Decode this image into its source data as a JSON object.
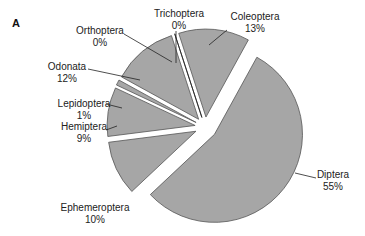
{
  "panel_label": "A",
  "chart_data": {
    "type": "pie",
    "title": "",
    "panel": "A",
    "exploded": true,
    "start_angle_deg": -18,
    "direction": "clockwise",
    "slice_color": "#a6a6a6",
    "edge_color": "#555555",
    "categories": [
      "Coleoptera",
      "Diptera",
      "Ephemeroptera",
      "Hemiptera",
      "Lepidoptera",
      "Odonata",
      "Orthoptera",
      "Trichoptera"
    ],
    "values": [
      13,
      55,
      10,
      9,
      1,
      12,
      0,
      0
    ],
    "labels": [
      "13%",
      "55%",
      "10%",
      "9%",
      "1%",
      "12%",
      "0%",
      "0%"
    ],
    "legend": "none"
  }
}
